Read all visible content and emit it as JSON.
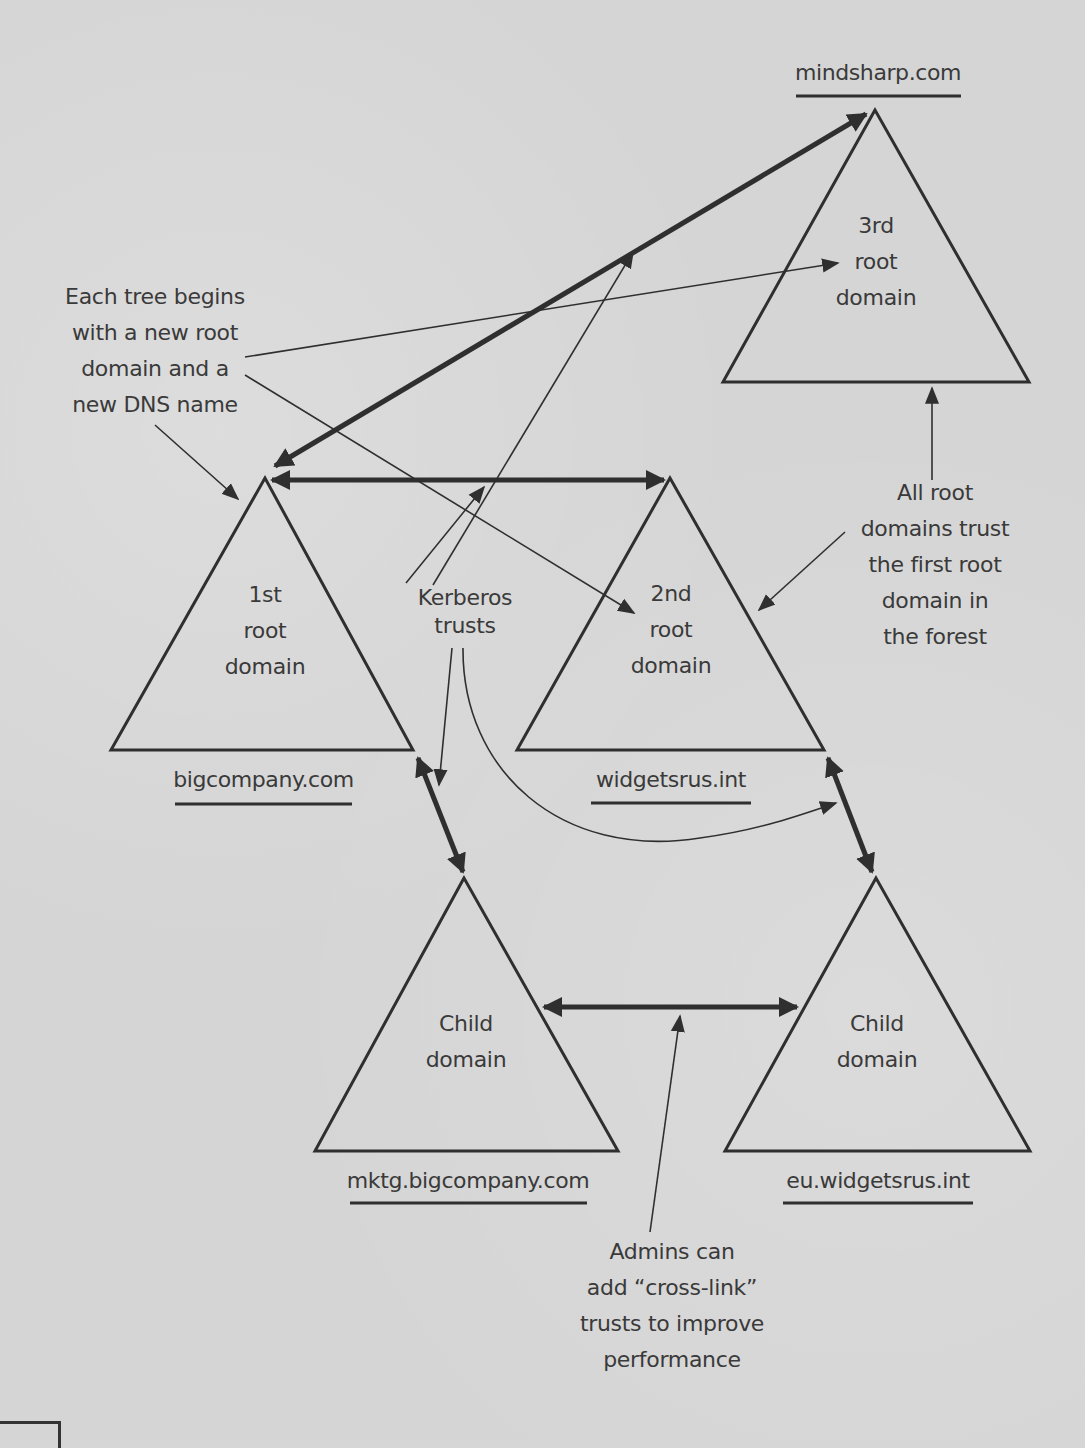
{
  "diagram": {
    "type": "active-directory-forest",
    "colors": {
      "background": "#d5d5d5",
      "line": "#2f2f2f",
      "text": "#3a3a3a"
    },
    "domains": [
      {
        "id": "root1",
        "label": "1st\nroot\ndomain",
        "dns_name": "bigcompany.com"
      },
      {
        "id": "root2",
        "label": "2nd\nroot\ndomain",
        "dns_name": "widgetsrus.int"
      },
      {
        "id": "root3",
        "label": "3rd\nroot\ndomain",
        "dns_name": "mindsharp.com"
      },
      {
        "id": "child1",
        "label": "Child\ndomain",
        "dns_name": "mktg.bigcompany.com"
      },
      {
        "id": "child2",
        "label": "Child\ndomain",
        "dns_name": "eu.widgetsrus.int"
      }
    ],
    "trusts": [
      {
        "from": "root1",
        "to": "root3",
        "kind": "two-way",
        "style": "thick"
      },
      {
        "from": "root1",
        "to": "root2",
        "kind": "two-way",
        "style": "thick"
      },
      {
        "from": "root1",
        "to": "child1",
        "kind": "two-way",
        "style": "thick"
      },
      {
        "from": "root2",
        "to": "child2",
        "kind": "two-way",
        "style": "thick"
      },
      {
        "from": "child1",
        "to": "child2",
        "kind": "two-way cross-link",
        "style": "thick"
      }
    ],
    "callouts": {
      "each_tree": "Each tree begins\nwith a new root\ndomain and a\nnew DNS name",
      "kerberos": "Kerberos\ntrusts",
      "all_root": "All root\ndomains trust\nthe first root\ndomain in\nthe forest",
      "admins": "Admins can\nadd “cross-link”\ntrusts to improve\nperformance"
    }
  }
}
